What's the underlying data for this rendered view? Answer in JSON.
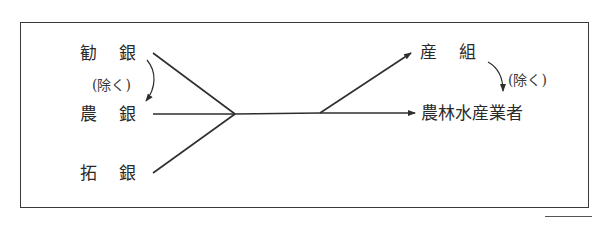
{
  "diagram": {
    "sources": [
      {
        "id": "kangin",
        "label": "勧銀"
      },
      {
        "id": "nogin",
        "label": "農銀"
      },
      {
        "id": "takugin",
        "label": "拓銀"
      }
    ],
    "left_note": "(除く)",
    "targets": [
      {
        "id": "sanso",
        "label": "産組"
      },
      {
        "id": "norinsuisangyosha",
        "label": "農林水産業者"
      }
    ],
    "right_note": "(除く)",
    "edges": [
      {
        "from": "勧銀",
        "to": "merge"
      },
      {
        "from": "農銀",
        "to": "merge"
      },
      {
        "from": "拓銀",
        "to": "merge"
      },
      {
        "from": "merge",
        "to": "産組"
      },
      {
        "from": "merge",
        "to": "農林水産業者"
      }
    ],
    "exclusions": [
      {
        "from": "勧銀",
        "to": "農銀",
        "note": "(除く)"
      },
      {
        "from": "産組",
        "to": "農林水産業者",
        "note": "(除く)"
      }
    ],
    "colors": {
      "line": "#2e2e2e",
      "text": "#2a2a2a",
      "frame": "#3a3a3a"
    }
  }
}
